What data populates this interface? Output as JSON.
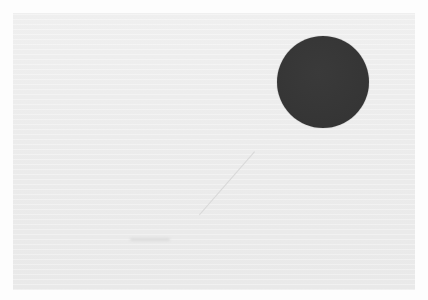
{
  "image": {
    "background_color": "#ffffff",
    "panel_color": "#ececec",
    "circle": {
      "color": "#3a3a3a",
      "center_x": 323,
      "center_y": 82,
      "radius": 46
    },
    "scratch": {
      "color": "#d6d6d6",
      "x1": 255,
      "y1": 152,
      "x2": 200,
      "y2": 215
    },
    "smudge": {
      "color": "#dcdcdc",
      "x": 130,
      "y": 238,
      "width": 40
    }
  }
}
